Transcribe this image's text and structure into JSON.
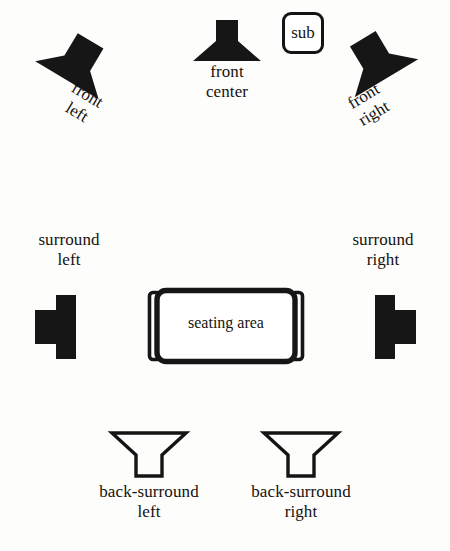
{
  "diagram": {
    "background_color": "#fdfdfc",
    "ink_color": "#141414",
    "width": 450,
    "height": 551
  },
  "speakers": {
    "front_left": {
      "label": "front\nleft",
      "icon": "speaker-horn-icon",
      "style": "filled",
      "rotation_deg": 31
    },
    "front_center": {
      "label": "front\ncenter",
      "icon": "speaker-horn-icon",
      "style": "filled",
      "rotation_deg": 0
    },
    "front_right": {
      "label": "front\nright",
      "icon": "speaker-horn-icon",
      "style": "filled",
      "rotation_deg": -31
    },
    "subwoofer": {
      "label": "sub",
      "icon": "subwoofer-box-icon",
      "style": "outline"
    },
    "surround_left": {
      "label": "surround\nleft",
      "icon": "speaker-horn-icon",
      "style": "filled",
      "facing": "right"
    },
    "surround_right": {
      "label": "surround\nright",
      "icon": "speaker-horn-icon",
      "style": "filled",
      "facing": "left"
    },
    "back_surround_left": {
      "label": "back-surround\nleft",
      "icon": "speaker-horn-icon",
      "style": "outline",
      "facing": "up"
    },
    "back_surround_right": {
      "label": "back-surround\nright",
      "icon": "speaker-horn-icon",
      "style": "outline",
      "facing": "up"
    }
  },
  "seating": {
    "label": "seating area",
    "icon": "couch-icon"
  }
}
